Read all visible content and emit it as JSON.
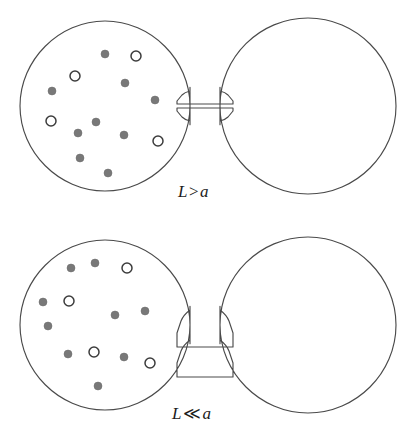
{
  "figure": {
    "background_color": "#ffffff",
    "outline_color": "#4a4a4a",
    "filled_particle_color": "#787878",
    "open_particle_color": "#3c3c3c",
    "width": 415,
    "height": 442
  },
  "panels": [
    {
      "id": "panel-top",
      "label": "L > a",
      "label_symbol": "L",
      "label_relation": ">",
      "label_operand": "a",
      "neck_description": "short wide neck",
      "left_chamber": {
        "name": "left-chamber",
        "center_x": 105,
        "center_y": 106,
        "radius": 85,
        "filled_particles": [
          {
            "cx": 105,
            "cy": 54,
            "r": 4.0
          },
          {
            "cx": 125,
            "cy": 83,
            "r": 4.0
          },
          {
            "cx": 52,
            "cy": 91,
            "r": 4.0
          },
          {
            "cx": 155,
            "cy": 100,
            "r": 4.0
          },
          {
            "cx": 96,
            "cy": 122,
            "r": 4.0
          },
          {
            "cx": 78,
            "cy": 133,
            "r": 4.0
          },
          {
            "cx": 124,
            "cy": 135,
            "r": 4.0
          },
          {
            "cx": 80,
            "cy": 158,
            "r": 4.0
          },
          {
            "cx": 108,
            "cy": 173,
            "r": 4.0
          }
        ],
        "open_particles": [
          {
            "cx": 136,
            "cy": 56,
            "r": 5.0
          },
          {
            "cx": 75,
            "cy": 76,
            "r": 5.0
          },
          {
            "cx": 51,
            "cy": 121,
            "r": 5.0
          },
          {
            "cx": 158,
            "cy": 141,
            "r": 5.0
          }
        ]
      },
      "right_chamber": {
        "name": "right-chamber",
        "center_x": 308,
        "center_y": 106,
        "radius": 88,
        "filled_particles": [],
        "open_particles": []
      }
    },
    {
      "id": "panel-bottom",
      "label": "L ≪ a",
      "label_symbol": "L",
      "label_relation": "≪",
      "label_operand": "a",
      "neck_description": "long narrow neck",
      "left_chamber": {
        "name": "left-chamber",
        "center_x": 105,
        "center_y": 104,
        "radius": 85,
        "filled_particles": [
          {
            "cx": 71,
            "cy": 47,
            "r": 4.0
          },
          {
            "cx": 95,
            "cy": 42,
            "r": 4.0
          },
          {
            "cx": 43,
            "cy": 81,
            "r": 4.0
          },
          {
            "cx": 48,
            "cy": 105,
            "r": 4.0
          },
          {
            "cx": 115,
            "cy": 94,
            "r": 4.0
          },
          {
            "cx": 145,
            "cy": 90,
            "r": 4.0
          },
          {
            "cx": 68,
            "cy": 133,
            "r": 4.0
          },
          {
            "cx": 98,
            "cy": 165,
            "r": 4.0
          },
          {
            "cx": 124,
            "cy": 136,
            "r": 4.0
          }
        ],
        "open_particles": [
          {
            "cx": 127,
            "cy": 47,
            "r": 5.0
          },
          {
            "cx": 69,
            "cy": 80,
            "r": 5.0
          },
          {
            "cx": 94,
            "cy": 131,
            "r": 5.0
          },
          {
            "cx": 150,
            "cy": 142,
            "r": 5.0
          }
        ]
      },
      "right_chamber": {
        "name": "right-chamber",
        "center_x": 308,
        "center_y": 104,
        "radius": 88,
        "filled_particles": [],
        "open_particles": []
      }
    }
  ]
}
